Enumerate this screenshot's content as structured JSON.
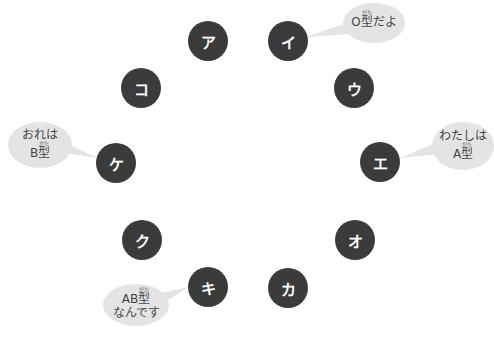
{
  "colors": {
    "node_fill": "#3b3b3b",
    "node_text": "#ffffff",
    "bubble_fill": "#e4e4e4",
    "bubble_text": "#444444"
  },
  "nodes": [
    {
      "id": "a",
      "label": "ア",
      "cx": 208,
      "cy": 41
    },
    {
      "id": "i",
      "label": "イ",
      "cx": 288,
      "cy": 41
    },
    {
      "id": "u",
      "label": "ウ",
      "cx": 354,
      "cy": 88
    },
    {
      "id": "e",
      "label": "エ",
      "cx": 380,
      "cy": 162
    },
    {
      "id": "o",
      "label": "オ",
      "cx": 355,
      "cy": 240
    },
    {
      "id": "ka",
      "label": "カ",
      "cx": 288,
      "cy": 288
    },
    {
      "id": "ki",
      "label": "キ",
      "cx": 208,
      "cy": 287
    },
    {
      "id": "ku",
      "label": "ク",
      "cx": 142,
      "cy": 240
    },
    {
      "id": "ke",
      "label": "ケ",
      "cx": 116,
      "cy": 163
    },
    {
      "id": "ko",
      "label": "コ",
      "cx": 141,
      "cy": 88
    }
  ],
  "bubbles": [
    {
      "id": "bubble-o",
      "speaker": "イ",
      "lines": [
        {
          "pre": "O",
          "kanji": "型",
          "ruby": "がた",
          "post": "だよ"
        }
      ]
    },
    {
      "id": "bubble-a",
      "speaker": "エ",
      "lines": [
        {
          "text": "わたしは"
        },
        {
          "pre": "A",
          "kanji": "型",
          "ruby": "がた",
          "post": ""
        }
      ]
    },
    {
      "id": "bubble-b",
      "speaker": "ケ",
      "lines": [
        {
          "text": "おれは"
        },
        {
          "pre": "B",
          "kanji": "型",
          "ruby": "がた",
          "post": ""
        }
      ]
    },
    {
      "id": "bubble-ab",
      "speaker": "キ",
      "lines": [
        {
          "pre": "AB",
          "kanji": "型",
          "ruby": "がた",
          "post": ""
        },
        {
          "text": "なんです"
        }
      ]
    }
  ]
}
